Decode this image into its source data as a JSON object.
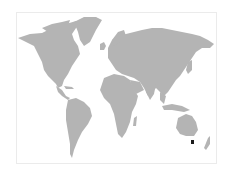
{
  "map": {
    "type": "world-map",
    "land_color": "#b4b4b4",
    "background_color": "#ffffff",
    "frame_color": "#ebebeb",
    "marker": {
      "label": "",
      "region": "Tasmania, Australia",
      "color": "#1a1a1a"
    }
  }
}
